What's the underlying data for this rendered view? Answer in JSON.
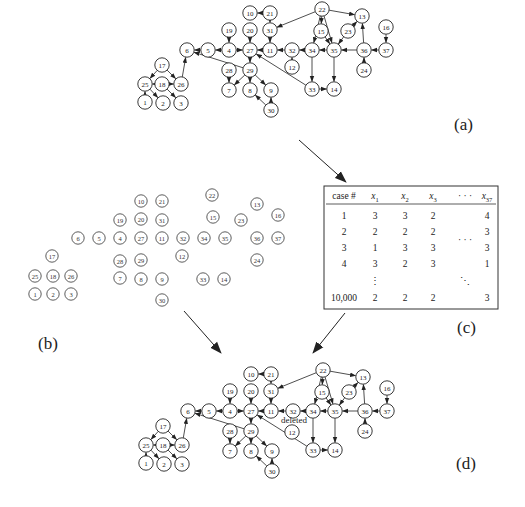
{
  "figure": {
    "panels": {
      "a": {
        "label": "(a)",
        "description": "original network"
      },
      "b": {
        "label": "(b)",
        "description": "nodes without edges"
      },
      "c": {
        "label": "(c)",
        "description": "sampled data table"
      },
      "d": {
        "label": "(d)",
        "description": "learned network"
      }
    },
    "nodes": [
      "1",
      "2",
      "3",
      "4",
      "5",
      "6",
      "7",
      "8",
      "9",
      "10",
      "11",
      "12",
      "13",
      "14",
      "15",
      "16",
      "17",
      "18",
      "19",
      "20",
      "21",
      "22",
      "23",
      "24",
      "25",
      "26",
      "27",
      "28",
      "29",
      "30",
      "31",
      "32",
      "33",
      "34",
      "35",
      "36",
      "37"
    ],
    "edges_a": [
      [
        "5",
        "6"
      ],
      [
        "4",
        "5"
      ],
      [
        "4",
        "27"
      ],
      [
        "19",
        "4"
      ],
      [
        "20",
        "27"
      ],
      [
        "21",
        "10"
      ],
      [
        "21",
        "31"
      ],
      [
        "31",
        "11"
      ],
      [
        "11",
        "27"
      ],
      [
        "32",
        "11"
      ],
      [
        "34",
        "32"
      ],
      [
        "35",
        "34"
      ],
      [
        "36",
        "35"
      ],
      [
        "37",
        "36"
      ],
      [
        "16",
        "37"
      ],
      [
        "24",
        "36"
      ],
      [
        "36",
        "13"
      ],
      [
        "23",
        "13"
      ],
      [
        "23",
        "35"
      ],
      [
        "22",
        "31"
      ],
      [
        "22",
        "34"
      ],
      [
        "22",
        "15"
      ],
      [
        "22",
        "35"
      ],
      [
        "22",
        "13"
      ],
      [
        "15",
        "35"
      ],
      [
        "34",
        "33"
      ],
      [
        "33",
        "14"
      ],
      [
        "35",
        "14"
      ],
      [
        "33",
        "27"
      ],
      [
        "29",
        "6"
      ],
      [
        "27",
        "29"
      ],
      [
        "29",
        "7"
      ],
      [
        "29",
        "8"
      ],
      [
        "29",
        "9"
      ],
      [
        "28",
        "7"
      ],
      [
        "30",
        "8"
      ],
      [
        "30",
        "9"
      ],
      [
        "26",
        "6"
      ],
      [
        "17",
        "25"
      ],
      [
        "17",
        "26"
      ],
      [
        "18",
        "26"
      ],
      [
        "18",
        "25"
      ],
      [
        "18",
        "3"
      ],
      [
        "25",
        "2"
      ],
      [
        "1",
        "25"
      ],
      [
        "12",
        "32"
      ]
    ],
    "edges_d": [
      [
        "5",
        "6"
      ],
      [
        "4",
        "5"
      ],
      [
        "4",
        "27"
      ],
      [
        "19",
        "4"
      ],
      [
        "20",
        "27"
      ],
      [
        "21",
        "10"
      ],
      [
        "21",
        "31"
      ],
      [
        "31",
        "11"
      ],
      [
        "11",
        "27"
      ],
      [
        "32",
        "11"
      ],
      [
        "34",
        "32"
      ],
      [
        "35",
        "34"
      ],
      [
        "36",
        "35"
      ],
      [
        "37",
        "36"
      ],
      [
        "16",
        "37"
      ],
      [
        "24",
        "36"
      ],
      [
        "36",
        "13"
      ],
      [
        "23",
        "13"
      ],
      [
        "23",
        "35"
      ],
      [
        "22",
        "31"
      ],
      [
        "22",
        "34"
      ],
      [
        "22",
        "15"
      ],
      [
        "22",
        "35"
      ],
      [
        "22",
        "13"
      ],
      [
        "15",
        "35"
      ],
      [
        "34",
        "33"
      ],
      [
        "33",
        "14"
      ],
      [
        "35",
        "14"
      ],
      [
        "33",
        "27"
      ],
      [
        "29",
        "6"
      ],
      [
        "27",
        "29"
      ],
      [
        "29",
        "7"
      ],
      [
        "29",
        "8"
      ],
      [
        "29",
        "9"
      ],
      [
        "28",
        "7"
      ],
      [
        "30",
        "8"
      ],
      [
        "30",
        "9"
      ],
      [
        "26",
        "6"
      ],
      [
        "17",
        "25"
      ],
      [
        "17",
        "26"
      ],
      [
        "18",
        "26"
      ],
      [
        "18",
        "25"
      ],
      [
        "18",
        "3"
      ],
      [
        "25",
        "2"
      ],
      [
        "1",
        "25"
      ]
    ],
    "deleted_edge": {
      "from": "12",
      "to": "32",
      "note": "deleted"
    },
    "table": {
      "headers": [
        "case #",
        "x1",
        "x2",
        "x3",
        "· · ·",
        "x37"
      ],
      "header_parts": [
        {
          "base": "case #",
          "sub": ""
        },
        {
          "base": "x",
          "sub": "1"
        },
        {
          "base": "x",
          "sub": "2"
        },
        {
          "base": "x",
          "sub": "3"
        },
        {
          "base": "· · ·",
          "sub": ""
        },
        {
          "base": "x",
          "sub": "37"
        }
      ],
      "rows": [
        [
          "1",
          "3",
          "3",
          "2",
          "",
          "4"
        ],
        [
          "2",
          "2",
          "2",
          "2",
          "· · ·",
          "3"
        ],
        [
          "3",
          "1",
          "3",
          "3",
          "",
          "3"
        ],
        [
          "4",
          "3",
          "2",
          "3",
          "",
          "1"
        ],
        [
          "",
          "⋮",
          "",
          "",
          "⋱",
          ""
        ],
        [
          "10,000",
          "2",
          "2",
          "2",
          "",
          "3"
        ]
      ]
    }
  }
}
